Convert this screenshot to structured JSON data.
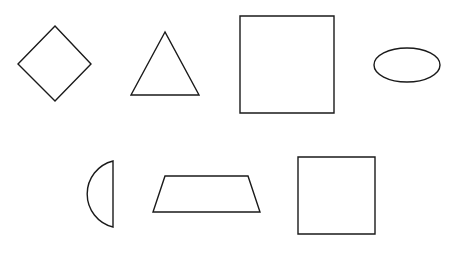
{
  "canvas": {
    "width": 464,
    "height": 260,
    "background": "#ffffff",
    "stroke": "#1a1a1a",
    "stroke_width": 1.4
  },
  "shapes": [
    {
      "id": "diamond",
      "type": "polygon",
      "points": "55,26 91,64 55,101 18,64"
    },
    {
      "id": "triangle",
      "type": "polygon",
      "points": "165,32 131,95 199,95"
    },
    {
      "id": "square-large",
      "type": "polygon",
      "points": "240,16 334,16 334,113 240,113"
    },
    {
      "id": "ellipse",
      "type": "ellipse",
      "cx": 407,
      "cy": 65,
      "rx": 33,
      "ry": 17
    },
    {
      "id": "half-circle",
      "type": "path",
      "d": "M113,161 A34,34 0 0,0 113,227 Z"
    },
    {
      "id": "trapezoid",
      "type": "polygon",
      "points": "165,176 248,176 260,212 153,212"
    },
    {
      "id": "square-small",
      "type": "polygon",
      "points": "298,157 375,157 375,234 298,234"
    }
  ]
}
